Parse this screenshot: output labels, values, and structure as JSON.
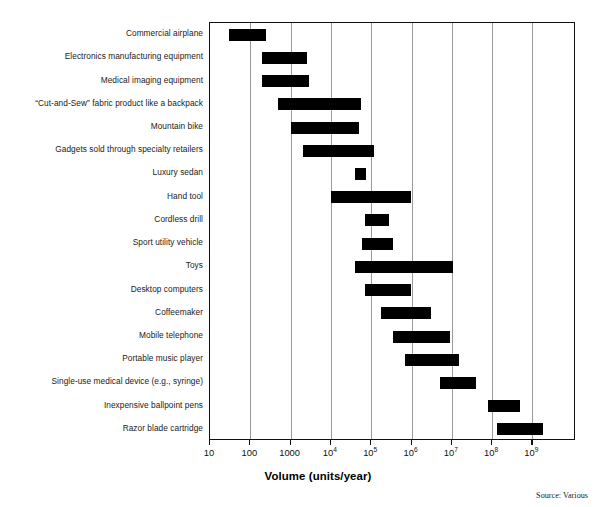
{
  "chart_data": {
    "type": "bar",
    "subtype": "horizontal-range-bar",
    "title": "",
    "xlabel": "Volume (units/year)",
    "ylabel": "",
    "xscale": "log",
    "xlim": [
      10,
      5000000000
    ],
    "grid": "vertical-only",
    "legend": "none",
    "source_note": "Source: Various",
    "xticks": [
      {
        "value": 10,
        "label": "10",
        "mantissa": "10",
        "exponent": ""
      },
      {
        "value": 100,
        "label": "100",
        "mantissa": "100",
        "exponent": ""
      },
      {
        "value": 1000,
        "label": "1000",
        "mantissa": "1000",
        "exponent": ""
      },
      {
        "value": 10000,
        "label": "10^4",
        "mantissa": "10",
        "exponent": "4"
      },
      {
        "value": 100000,
        "label": "10^5",
        "mantissa": "10",
        "exponent": "5"
      },
      {
        "value": 1000000,
        "label": "10^6",
        "mantissa": "10",
        "exponent": "6"
      },
      {
        "value": 10000000,
        "label": "10^7",
        "mantissa": "10",
        "exponent": "7"
      },
      {
        "value": 100000000,
        "label": "10^8",
        "mantissa": "10",
        "exponent": "8"
      },
      {
        "value": 1000000000,
        "label": "10^9",
        "mantissa": "10",
        "exponent": "9"
      }
    ],
    "categories": [
      "Commercial airplane",
      "Electronics manufacturing equipment",
      "Medical imaging equipment",
      "“Cut-and-Sew” fabric product like a backpack",
      "Mountain bike",
      "Gadgets sold through specialty retailers",
      "Luxury sedan",
      "Hand tool",
      "Cordless drill",
      "Sport utility vehicle",
      "Toys",
      "Desktop computers",
      "Coffeemaker",
      "Mobile telephone",
      "Portable music player",
      "Single-use medical device (e.g., syringe)",
      "Inexpensive ballpoint pens",
      "Razor blade cartridge"
    ],
    "ranges": [
      {
        "category": "Commercial airplane",
        "low": 30,
        "high": 250
      },
      {
        "category": "Electronics manufacturing equipment",
        "low": 200,
        "high": 2500
      },
      {
        "category": "Medical imaging equipment",
        "low": 200,
        "high": 2800
      },
      {
        "category": "“Cut-and-Sew” fabric product like a backpack",
        "low": 500,
        "high": 55000
      },
      {
        "category": "Mountain bike",
        "low": 1000,
        "high": 50000
      },
      {
        "category": "Gadgets sold through specialty retailers",
        "low": 2000,
        "high": 120000
      },
      {
        "category": "Luxury sedan",
        "low": 40000,
        "high": 75000
      },
      {
        "category": "Hand tool",
        "low": 10000,
        "high": 1000000
      },
      {
        "category": "Cordless drill",
        "low": 70000,
        "high": 280000
      },
      {
        "category": "Sport utility vehicle",
        "low": 60000,
        "high": 350000
      },
      {
        "category": "Toys",
        "low": 40000,
        "high": 11000000
      },
      {
        "category": "Desktop computers",
        "low": 70000,
        "high": 1000000
      },
      {
        "category": "Coffeemaker",
        "low": 180000,
        "high": 3000000
      },
      {
        "category": "Mobile telephone",
        "low": 350000,
        "high": 9000000
      },
      {
        "category": "Portable music player",
        "low": 700000,
        "high": 15000000
      },
      {
        "category": "Single-use medical device (e.g., syringe)",
        "low": 5000000,
        "high": 40000000
      },
      {
        "category": "Inexpensive ballpoint pens",
        "low": 80000000,
        "high": 500000000
      },
      {
        "category": "Razor blade cartridge",
        "low": 130000000,
        "high": 1800000000
      }
    ]
  },
  "axis": {
    "title": "Volume (units/year)"
  },
  "footer": {
    "source": "Source: Various"
  },
  "colors": {
    "bar": "#000000",
    "grid": "#9a9a9a",
    "frame": "#111111",
    "background": "#ffffff",
    "label_text": "#1a1a1a"
  }
}
